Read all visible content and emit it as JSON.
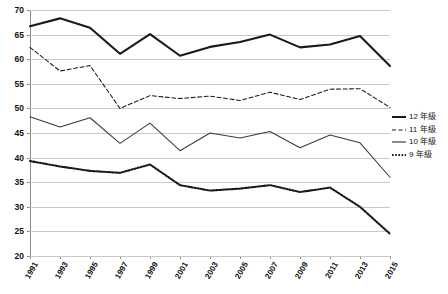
{
  "chart_data": {
    "type": "line",
    "title": "",
    "subtitle": "",
    "xlabel": "",
    "ylabel": "",
    "xlim": [
      1991,
      2015
    ],
    "ylim": [
      20,
      70
    ],
    "grid": true,
    "legend_position": "right",
    "categories": [
      "1991",
      "1993",
      "1995",
      "1997",
      "1999",
      "2001",
      "2003",
      "2005",
      "2007",
      "2009",
      "2011",
      "2013",
      "2015"
    ],
    "x": [
      1991,
      1993,
      1995,
      1997,
      1999,
      2001,
      2003,
      2005,
      2007,
      2009,
      2011,
      2013,
      2015
    ],
    "yticks": [
      20,
      25,
      30,
      35,
      40,
      45,
      50,
      55,
      60,
      65,
      70
    ],
    "series": [
      {
        "name": "12 年級",
        "style": "solid",
        "width": "thick",
        "color": "#1a1a1a",
        "values": [
          66.7,
          68.3,
          66.4,
          61.1,
          65.1,
          60.7,
          62.5,
          63.5,
          65.0,
          62.4,
          63.0,
          64.7,
          58.6
        ]
      },
      {
        "name": "11 年級",
        "style": "dashed",
        "width": "thin",
        "color": "#1a1a1a",
        "values": [
          62.4,
          57.6,
          58.7,
          50.0,
          52.6,
          52.0,
          52.5,
          51.6,
          53.3,
          51.8,
          53.9,
          54.0,
          50.2
        ]
      },
      {
        "name": "10 年級",
        "style": "solid",
        "width": "thin",
        "color": "#3a3a3a",
        "values": [
          48.3,
          46.2,
          48.1,
          42.9,
          47.0,
          41.4,
          45.0,
          44.0,
          45.3,
          42.0,
          44.6,
          43.0,
          36.0
        ]
      },
      {
        "name": "9 年級",
        "style": "dotted",
        "width": "thick",
        "color": "#1a1a1a",
        "values": [
          39.3,
          38.2,
          37.3,
          36.9,
          38.6,
          34.4,
          33.3,
          33.7,
          34.4,
          33.0,
          33.9,
          30.0,
          24.5
        ]
      }
    ]
  },
  "legend": {
    "items": [
      {
        "label": "12 年級",
        "style": "solid",
        "width": "thick"
      },
      {
        "label": "11 年級",
        "style": "dashed",
        "width": "thin"
      },
      {
        "label": "10 年級",
        "style": "solid",
        "width": "thin"
      },
      {
        "label": "9 年級",
        "style": "dotted",
        "width": "thick"
      }
    ]
  }
}
